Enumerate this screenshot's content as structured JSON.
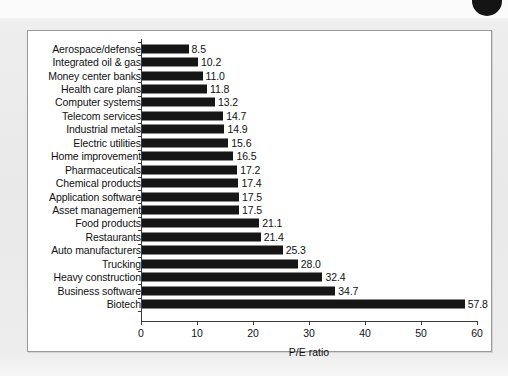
{
  "figure": {
    "panel_background": "#ffffff",
    "page_background": "#ececec",
    "bar_color": "#161616",
    "axis_color": "#3a3a3a",
    "corner_marker": "black-circle-marker"
  },
  "chart_data": {
    "type": "bar",
    "orientation": "horizontal",
    "title": "",
    "xlabel": "P/E ratio",
    "ylabel": "",
    "xlim": [
      0,
      60
    ],
    "xticks": [
      0,
      10,
      20,
      30,
      40,
      50,
      60
    ],
    "xtick_labels": [
      "0",
      "10",
      "20",
      "30",
      "40",
      "50",
      "60"
    ],
    "grid": false,
    "legend": null,
    "categories": [
      "Aerospace/defense",
      "Integrated oil & gas",
      "Money center banks",
      "Health care plans",
      "Computer systems",
      "Telecom services",
      "Industrial metals",
      "Electric utilities",
      "Home improvement",
      "Pharmaceuticals",
      "Chemical products",
      "Application software",
      "Asset management",
      "Food products",
      "Restaurants",
      "Auto manufacturers",
      "Trucking",
      "Heavy construction",
      "Business software",
      "Biotech"
    ],
    "values": [
      8.5,
      10.2,
      11.0,
      11.8,
      13.2,
      14.7,
      14.9,
      15.6,
      16.5,
      17.2,
      17.4,
      17.5,
      17.5,
      21.1,
      21.4,
      25.3,
      28.0,
      32.4,
      34.7,
      57.8
    ],
    "value_labels": [
      "8.5",
      "10.2",
      "11.0",
      "11.8",
      "13.2",
      "14.7",
      "14.9",
      "15.6",
      "16.5",
      "17.2",
      "17.4",
      "17.5",
      "17.5",
      "21.1",
      "21.4",
      "25.3",
      "28.0",
      "32.4",
      "34.7",
      "57.8"
    ]
  }
}
